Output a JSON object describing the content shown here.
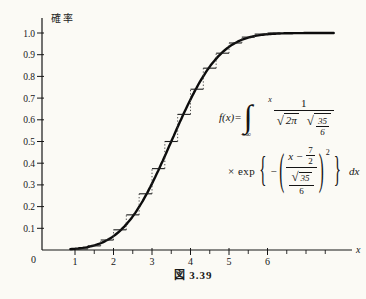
{
  "chart_data": {
    "type": "line",
    "title": "",
    "caption": "図 3.39",
    "xlabel": "x",
    "ylabel": "確率",
    "xlim": [
      0,
      8.2
    ],
    "ylim": [
      0,
      1.08
    ],
    "grid": false,
    "legend": "none",
    "origin_label": "0",
    "x_major_ticks": [
      1,
      2,
      3,
      4,
      5,
      6
    ],
    "x_major_tick_labels": [
      "1",
      "2",
      "3",
      "4",
      "5",
      "6"
    ],
    "x_minor_ticks": [
      1.5,
      2.5,
      3.5,
      4.5,
      5.5,
      6.5,
      7,
      7.5
    ],
    "y_ticks": [
      0.1,
      0.2,
      0.3,
      0.4,
      0.5,
      0.6,
      0.7,
      0.8,
      0.9,
      1.0
    ],
    "y_tick_labels": [
      "0.1",
      "0.2",
      "0.3",
      "0.4",
      "0.5",
      "0.6",
      "0.7",
      "0.8",
      "0.9",
      "1.0"
    ],
    "series": [
      {
        "name": "normal-cdf-curve",
        "type": "smooth-line",
        "description": "cumulative normal distribution with mean 7/2 and s.d. √35/6",
        "mean": 3.5,
        "sigma": 0.986,
        "x_range": [
          0.88,
          7.75
        ],
        "points_x": [
          1,
          1.5,
          2,
          2.5,
          3,
          3.5,
          4,
          4.5,
          5,
          5.5,
          6,
          6.5,
          7,
          7.5
        ],
        "points_y": [
          0.006,
          0.021,
          0.064,
          0.155,
          0.306,
          0.5,
          0.694,
          0.845,
          0.936,
          0.979,
          0.994,
          0.999,
          1.0,
          1.0
        ]
      },
      {
        "name": "empirical-cdf-steps",
        "type": "step",
        "step_width": 0.333,
        "x": [
          1,
          1.333,
          1.667,
          2,
          2.333,
          2.667,
          3,
          3.333,
          3.667,
          4,
          4.333,
          4.667,
          5,
          5.333,
          5.667,
          6
        ],
        "y": [
          0.005,
          0.019,
          0.046,
          0.093,
          0.162,
          0.259,
          0.375,
          0.5,
          0.625,
          0.741,
          0.838,
          0.907,
          0.954,
          0.981,
          0.995,
          1.0
        ]
      }
    ],
    "colors": {
      "curve": "#0c0c0c",
      "steps": "#1d1d1d",
      "axis": "#161616",
      "background": "#fbfaf5"
    }
  },
  "formula": {
    "lhs": "f(x)=",
    "integral": "∫",
    "upper": "x",
    "lower": "−∞",
    "one": "1",
    "rad": "√",
    "two_pi": "2π",
    "n35": "35",
    "n6": "6",
    "times_exp": "× exp",
    "lbrace": "{",
    "minus": "−",
    "lparen": "(",
    "x_minus": "x −",
    "seven": "7",
    "two": "2",
    "rparen": ")",
    "sq": "2",
    "rbrace": "}",
    "dx": "dx"
  }
}
